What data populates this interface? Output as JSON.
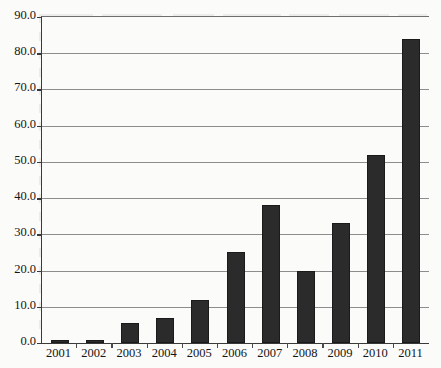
{
  "chart_data": {
    "type": "bar",
    "title": "",
    "subtitle": "",
    "xlabel": "",
    "ylabel": "",
    "categories": [
      "2001",
      "2002",
      "2003",
      "2004",
      "2005",
      "2006",
      "2007",
      "2008",
      "2009",
      "2010",
      "2011"
    ],
    "values": [
      0.8,
      0.9,
      5.5,
      7.0,
      12.0,
      25.0,
      38.0,
      19.8,
      33.0,
      52.0,
      84.0
    ],
    "ylim": [
      0.0,
      90.0
    ],
    "ytick_step": 10.0,
    "ytick_labels": [
      "0.0",
      "10.0",
      "20.0",
      "30.0",
      "40.0",
      "50.0",
      "60.0",
      "70.0",
      "80.0",
      "90.0"
    ],
    "grid": true,
    "grid_axis": "y",
    "legend": false,
    "legend_position": "none",
    "bar_color": "#2b2b2b",
    "grid_color": "#8d8d8d",
    "axis_color": "#3a3a3a",
    "background_color": "#fbfbfa",
    "annotations": []
  }
}
